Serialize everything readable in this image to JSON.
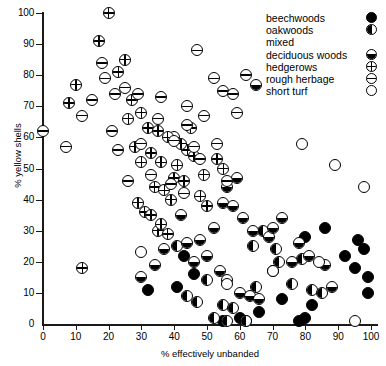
{
  "chart_data": {
    "type": "scatter",
    "title": "",
    "xlabel": "% effectively unbanded",
    "ylabel": "% yellow shells",
    "xlim": [
      0,
      100
    ],
    "ylim": [
      0,
      100
    ],
    "xticks": [
      0,
      10,
      20,
      30,
      40,
      50,
      60,
      70,
      80,
      90,
      100
    ],
    "yticks": [
      0,
      10,
      20,
      30,
      40,
      50,
      60,
      70,
      80,
      90,
      100
    ],
    "grid": false,
    "legend_position": "top-right",
    "series": [
      {
        "name": "beechwoods",
        "marker": "filled-circle",
        "points": [
          [
            55,
            1
          ],
          [
            60,
            2
          ],
          [
            62,
            1
          ],
          [
            66,
            4
          ],
          [
            78,
            1
          ],
          [
            80,
            2
          ],
          [
            80,
            28
          ],
          [
            82,
            6
          ],
          [
            86,
            31
          ],
          [
            92,
            22
          ],
          [
            95,
            18
          ],
          [
            96,
            27
          ],
          [
            98,
            24
          ],
          [
            99,
            15
          ],
          [
            99,
            10
          ],
          [
            73,
            8
          ],
          [
            32,
            11
          ],
          [
            41,
            12
          ],
          [
            43,
            22
          ],
          [
            46,
            16
          ]
        ]
      },
      {
        "name": "oakwoods",
        "marker": "left-half-filled-circle",
        "points": [
          [
            52,
            2
          ],
          [
            56,
            1
          ],
          [
            62,
            1
          ],
          [
            55,
            6
          ],
          [
            58,
            5
          ],
          [
            65,
            12
          ],
          [
            70,
            17
          ],
          [
            72,
            20
          ],
          [
            76,
            13
          ],
          [
            82,
            11
          ],
          [
            85,
            10
          ],
          [
            44,
            9
          ],
          [
            47,
            7
          ],
          [
            50,
            14
          ],
          [
            41,
            25
          ],
          [
            67,
            30
          ],
          [
            64,
            25
          ],
          [
            71,
            24
          ],
          [
            79,
            21
          ]
        ]
      },
      {
        "name": "mixed deciduous woods",
        "marker": "bottom-half-filled-circle",
        "points": [
          [
            55,
            39
          ],
          [
            58,
            38
          ],
          [
            61,
            34
          ],
          [
            64,
            30
          ],
          [
            52,
            31
          ],
          [
            48,
            27
          ],
          [
            50,
            22
          ],
          [
            46,
            20
          ],
          [
            44,
            26
          ],
          [
            54,
            17
          ],
          [
            56,
            14
          ],
          [
            60,
            10
          ],
          [
            63,
            9
          ],
          [
            66,
            8
          ],
          [
            69,
            28
          ],
          [
            73,
            34
          ],
          [
            76,
            20
          ],
          [
            78,
            26
          ],
          [
            81,
            22
          ],
          [
            88,
            12
          ],
          [
            42,
            35
          ],
          [
            37,
            24
          ],
          [
            34,
            19
          ],
          [
            30,
            15
          ],
          [
            56,
            44
          ],
          [
            59,
            47
          ],
          [
            65,
            77
          ],
          [
            40,
            60
          ],
          [
            70,
            31
          ],
          [
            86,
            19
          ]
        ]
      },
      {
        "name": "hedgerows",
        "marker": "plus-circle",
        "points": [
          [
            10,
            77
          ],
          [
            8,
            71
          ],
          [
            17,
            91
          ],
          [
            23,
            81
          ],
          [
            27,
            72
          ],
          [
            30,
            68
          ],
          [
            26,
            66
          ],
          [
            32,
            63
          ],
          [
            35,
            62
          ],
          [
            38,
            60
          ],
          [
            28,
            57
          ],
          [
            33,
            55
          ],
          [
            30,
            52
          ],
          [
            36,
            52
          ],
          [
            40,
            47
          ],
          [
            43,
            46
          ],
          [
            20,
            100
          ],
          [
            25,
            85
          ],
          [
            34,
            44
          ],
          [
            37,
            43
          ],
          [
            39,
            40
          ],
          [
            29,
            39
          ],
          [
            31,
            36
          ],
          [
            33,
            35
          ],
          [
            12,
            18
          ],
          [
            44,
            56
          ],
          [
            46,
            54
          ],
          [
            41,
            51
          ],
          [
            48,
            41
          ],
          [
            50,
            38
          ],
          [
            35,
            30
          ],
          [
            38,
            29
          ],
          [
            36,
            32
          ],
          [
            42,
            58
          ],
          [
            45,
            63
          ],
          [
            53,
            53
          ],
          [
            55,
            50
          ],
          [
            49,
            48
          ]
        ]
      },
      {
        "name": "rough herbage",
        "marker": "minus-circle",
        "points": [
          [
            0,
            62
          ],
          [
            7,
            57
          ],
          [
            12,
            67
          ],
          [
            18,
            84
          ],
          [
            19,
            79
          ],
          [
            22,
            74
          ],
          [
            25,
            76
          ],
          [
            29,
            74
          ],
          [
            36,
            73
          ],
          [
            44,
            70
          ],
          [
            47,
            88
          ],
          [
            52,
            79
          ],
          [
            55,
            75
          ],
          [
            58,
            74
          ],
          [
            49,
            67
          ],
          [
            44,
            64
          ],
          [
            40,
            59
          ],
          [
            46,
            57
          ],
          [
            53,
            58
          ],
          [
            33,
            48
          ],
          [
            43,
            42
          ],
          [
            39,
            45
          ],
          [
            26,
            46
          ],
          [
            23,
            56
          ],
          [
            35,
            66
          ],
          [
            48,
            53
          ],
          [
            56,
            46
          ],
          [
            30,
            58
          ],
          [
            15,
            72
          ],
          [
            21,
            62
          ],
          [
            62,
            80
          ],
          [
            59,
            68
          ]
        ]
      },
      {
        "name": "short turf",
        "marker": "open-circle",
        "points": [
          [
            30,
            23
          ],
          [
            56,
            13
          ],
          [
            79,
            58
          ],
          [
            89,
            51
          ],
          [
            95,
            1
          ],
          [
            98,
            44
          ],
          [
            70,
            17
          ],
          [
            84,
            20
          ]
        ]
      }
    ]
  },
  "legend": {
    "items": [
      {
        "label": "beechwoods",
        "marker": "filled-circle"
      },
      {
        "label": "oakwoods",
        "marker": "left-half-filled-circle"
      },
      {
        "label": "mixed",
        "marker": ""
      },
      {
        "label": "deciduous woods",
        "marker": "bottom-half-filled-circle"
      },
      {
        "label": "hedgerows",
        "marker": "plus-circle"
      },
      {
        "label": "rough herbage",
        "marker": "minus-circle"
      },
      {
        "label": "short turf",
        "marker": "open-circle"
      }
    ]
  }
}
